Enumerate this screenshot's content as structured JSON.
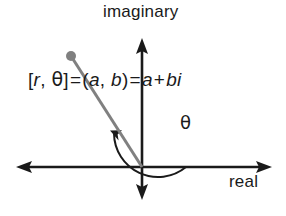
{
  "figure": {
    "background_color": "#ffffff",
    "axis_color": "#1a1a1a",
    "vector_color": "#808080",
    "arc_color": "#1a1a1a"
  },
  "axes": {
    "vertical_label": "imaginary",
    "horizontal_label": "real",
    "origin": {
      "x": 142,
      "y": 167
    },
    "horizontal_extent": {
      "left": 16,
      "right": 272
    },
    "vertical_extent": {
      "top": 38,
      "bottom": 200
    }
  },
  "angle": {
    "symbol": "θ",
    "arc_radius": 44,
    "arc_start_degrees": 0,
    "arc_end_degrees": 132
  },
  "vector": {
    "point": {
      "x": 71,
      "y": 56
    },
    "dot_radius": 5,
    "color": "#808080"
  },
  "equation": {
    "polar_open": "[",
    "polar_r": "r",
    "polar_comma": ", ",
    "polar_theta": "θ",
    "polar_close": "]",
    "equals_one": "=",
    "rect_open": "(",
    "rect_a": "a",
    "rect_comma": ", ",
    "rect_b": "b",
    "rect_close": ")",
    "equals_two": "=",
    "sum_a": "a",
    "plus": "+",
    "sum_bi": "bi",
    "full_text": "[r, θ] = (a, b) = a + bi"
  }
}
